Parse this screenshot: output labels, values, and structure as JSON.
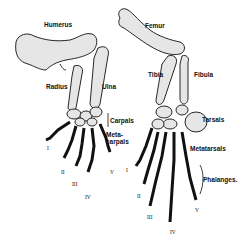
{
  "forelimb": {
    "labels": {
      "humerus": "Humerus",
      "radius": "Radius",
      "ulna": "Ulna",
      "carpals": "Carpals",
      "metacarpals_line1": "Meta-",
      "metacarpals_line2": "carpals"
    },
    "digits": [
      "I",
      "II",
      "III",
      "IV",
      "V"
    ]
  },
  "hindlimb": {
    "labels": {
      "femur": "Femur",
      "tibia": "Tibia",
      "fibula": "Fibula",
      "tarsals": "Tarsals",
      "metatarsals": "Metatarsals",
      "phalanges": "Phalanges."
    },
    "digits": [
      "I",
      "II",
      "III",
      "IV",
      "V"
    ]
  },
  "colors": {
    "ink": "#111111",
    "bone_fill": "#e6e6e6",
    "background": "#ffffff"
  }
}
